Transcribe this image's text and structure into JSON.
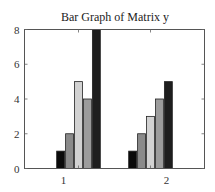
{
  "chart_data": {
    "type": "bar",
    "title": "Bar Graph of Matrix y",
    "xlabel": "",
    "ylabel": "",
    "categories": [
      "1",
      "2"
    ],
    "series": [
      {
        "name": "column 1",
        "color": "#0a0a0a",
        "values": [
          1,
          1
        ]
      },
      {
        "name": "column 2",
        "color": "#8a8a8a",
        "values": [
          2,
          2
        ]
      },
      {
        "name": "column 3",
        "color": "#d2d2d2",
        "values": [
          5,
          3
        ]
      },
      {
        "name": "column 4",
        "color": "#9c9c9c",
        "values": [
          4,
          4
        ]
      },
      {
        "name": "column 5",
        "color": "#1e1e1e",
        "values": [
          8,
          5
        ]
      }
    ],
    "ylim": [
      0,
      8
    ],
    "yticks": [
      0,
      2,
      4,
      6,
      8
    ],
    "grid": false,
    "legend": "none"
  }
}
